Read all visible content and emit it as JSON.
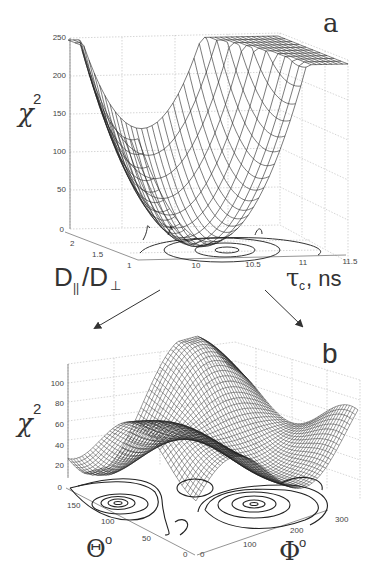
{
  "figure": {
    "panels": [
      {
        "id": "a",
        "letter": "a"
      },
      {
        "id": "b",
        "letter": "b"
      }
    ]
  },
  "panel_a": {
    "letter": "a",
    "zlabel": "χ",
    "zlabel_sup": "2",
    "xlabel_main": "D",
    "xlabel_sub1": "||",
    "xlabel_slash": "/D",
    "xlabel_sub2": "⊥",
    "ylabel_main": "τ",
    "ylabel_sub": "c",
    "ylabel_unit": ", ns",
    "z_ticks": [
      "0",
      "50",
      "100",
      "150",
      "200",
      "250"
    ],
    "x_ticks": [
      "1",
      "1.5",
      "2"
    ],
    "y_ticks": [
      "10",
      "10.5",
      "11",
      "11.5"
    ]
  },
  "panel_b": {
    "letter": "b",
    "zlabel": "χ",
    "zlabel_sup": "2",
    "theta_label": "Θ",
    "theta_sup": "o",
    "phi_label": "Φ",
    "phi_sup": "o",
    "z_ticks": [
      "0",
      "20",
      "40",
      "60",
      "80",
      "100"
    ],
    "theta_ticks": [
      "0",
      "50",
      "100",
      "150"
    ],
    "phi_ticks": [
      "0",
      "100",
      "200",
      "300"
    ]
  },
  "chart_data": [
    {
      "type": "surface",
      "title": "a",
      "xlabel": "D||/D⊥",
      "ylabel": "τc, ns",
      "zlabel": "χ²",
      "xlim": [
        1,
        2.2
      ],
      "ylim": [
        9.5,
        11.5
      ],
      "zlim": [
        0,
        250
      ],
      "x_ticks": [
        1,
        1.5,
        2
      ],
      "y_ticks": [
        10,
        10.5,
        11,
        11.5
      ],
      "z_ticks": [
        0,
        50,
        100,
        150,
        200,
        250
      ],
      "grid": true,
      "minimum": {
        "x": 1.3,
        "y": 10.2,
        "z": 5
      },
      "corner_values": {
        "x1_y9.5": 200,
        "x1_y11.5": 145,
        "x2.2_y9.5": 195,
        "x2.2_y11.5": 130
      },
      "contours": "projected on base plane, centered near D||/D⊥≈1.3, τc≈10.2 ns"
    },
    {
      "type": "surface",
      "title": "b",
      "xlabel": "Φ°",
      "ylabel": "Θ°",
      "zlabel": "χ²",
      "xlim": [
        0,
        360
      ],
      "ylim": [
        0,
        180
      ],
      "zlim": [
        0,
        110
      ],
      "x_ticks": [
        0,
        100,
        200,
        300
      ],
      "y_ticks": [
        0,
        50,
        100,
        150
      ],
      "z_ticks": [
        0,
        20,
        40,
        60,
        80,
        100
      ],
      "grid": true,
      "minima": [
        {
          "phi": 90,
          "theta": 130,
          "chi2": 12
        },
        {
          "phi": 270,
          "theta": 50,
          "chi2": 12
        }
      ],
      "maxima": [
        {
          "phi": 180,
          "theta": 90,
          "chi2": 105
        },
        {
          "phi": 330,
          "theta": 130,
          "chi2": 100
        }
      ],
      "contours": "projected on base plane"
    }
  ]
}
